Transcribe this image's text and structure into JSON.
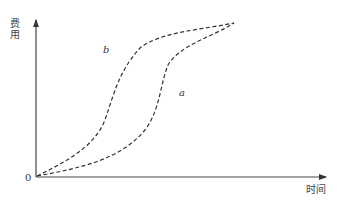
{
  "diagram": {
    "y_axis_label": "费用",
    "x_axis_label": "时间",
    "origin_label": "0",
    "curves": [
      {
        "name": "b",
        "label": "b",
        "style": "dashed"
      },
      {
        "name": "a",
        "label": "a",
        "style": "dashed"
      }
    ],
    "colors": {
      "line": "#333333",
      "background": "#ffffff"
    }
  }
}
